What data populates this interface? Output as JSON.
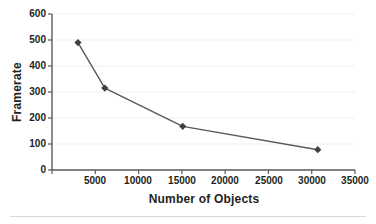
{
  "chart_data": {
    "type": "line",
    "title": "",
    "xlabel": "Number of Objects",
    "ylabel": "Framerate",
    "x": [
      3000,
      6100,
      15100,
      30700
    ],
    "values": [
      490,
      315,
      168,
      78
    ],
    "series": [
      {
        "name": "Framerate",
        "x": [
          3000,
          6100,
          15100,
          30700
        ],
        "values": [
          490,
          315,
          168,
          78
        ]
      }
    ],
    "xlim": [
      0,
      35000
    ],
    "ylim": [
      0,
      600
    ],
    "xticks": [
      0,
      5000,
      10000,
      15000,
      20000,
      25000,
      30000,
      35000
    ],
    "xtick_labels": [
      "",
      "5000",
      "10000",
      "15000",
      "20000",
      "25000",
      "30000",
      "35000"
    ],
    "yticks": [
      0,
      100,
      200,
      300,
      400,
      500,
      600
    ],
    "ytick_labels": [
      "0",
      "100",
      "200",
      "300",
      "400",
      "500",
      "600"
    ],
    "grid": "horizontal",
    "legend": "none",
    "marker": "diamond",
    "line_color": "#58595b",
    "marker_color": "#404042",
    "gridline_color": "#efeff0",
    "axis_color": "#58595b"
  },
  "axes": {
    "y_title": "Framerate",
    "x_title": "Number of Objects"
  }
}
